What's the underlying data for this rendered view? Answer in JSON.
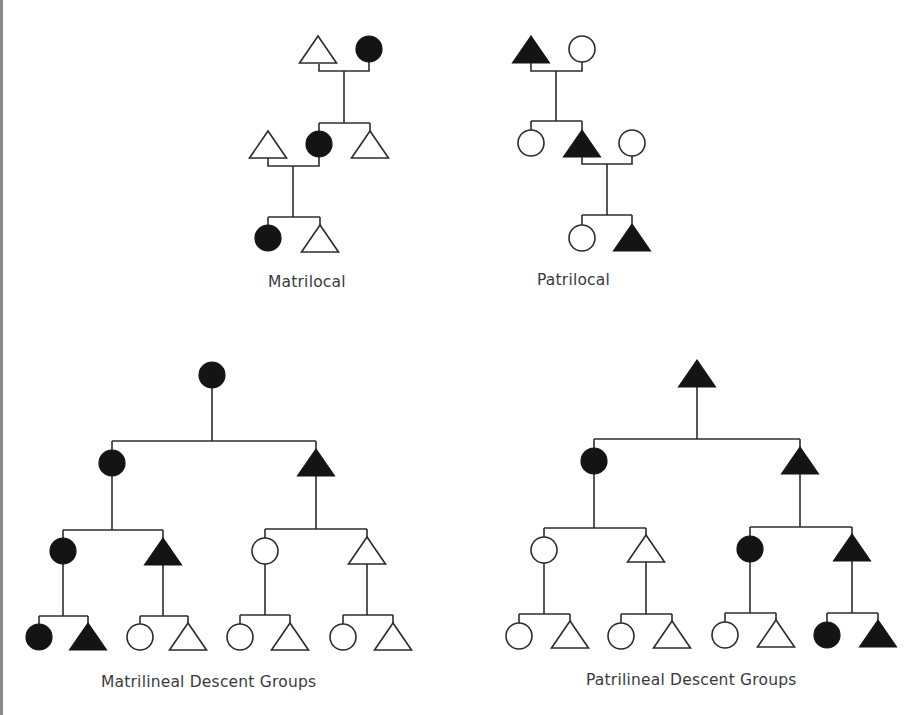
{
  "diagram": {
    "legend": {
      "female_shape": "circle",
      "male_shape": "triangle",
      "filled_meaning": "member of descent group / resident",
      "fill_color": "#141414",
      "line_color": "#2c2c2c",
      "label_color": "#3a3a3a"
    },
    "panels": [
      {
        "id": "matrilocal",
        "label": "Matrilocal",
        "label_pos": [
          268,
          287
        ],
        "nodes": [
          {
            "shape": "triangle",
            "filled": false,
            "x": 318,
            "y": 50
          },
          {
            "shape": "circle",
            "filled": true,
            "x": 369,
            "y": 49
          },
          {
            "shape": "triangle",
            "filled": false,
            "x": 268,
            "y": 145
          },
          {
            "shape": "circle",
            "filled": true,
            "x": 319,
            "y": 144
          },
          {
            "shape": "triangle",
            "filled": false,
            "x": 370,
            "y": 145
          },
          {
            "shape": "circle",
            "filled": true,
            "x": 268,
            "y": 238
          },
          {
            "shape": "triangle",
            "filled": false,
            "x": 320,
            "y": 239
          }
        ],
        "lines": [
          "M319,64 V71 H369 V62",
          "M344,71 V123",
          "M319,123 H370",
          "M319,123 V131",
          "M370,123 V132",
          "M268,158 V166 H319 V157",
          "M293,166 V217",
          "M268,217 H320",
          "M268,217 V225",
          "M320,217 V226"
        ]
      },
      {
        "id": "patrilocal",
        "label": "Patrilocal",
        "label_pos": [
          537,
          285
        ],
        "nodes": [
          {
            "shape": "triangle",
            "filled": true,
            "x": 531,
            "y": 50
          },
          {
            "shape": "circle",
            "filled": false,
            "x": 582,
            "y": 49
          },
          {
            "shape": "circle",
            "filled": false,
            "x": 531,
            "y": 143
          },
          {
            "shape": "triangle",
            "filled": true,
            "x": 582,
            "y": 144
          },
          {
            "shape": "circle",
            "filled": false,
            "x": 632,
            "y": 143
          },
          {
            "shape": "circle",
            "filled": false,
            "x": 582,
            "y": 238
          },
          {
            "shape": "triangle",
            "filled": true,
            "x": 632,
            "y": 238
          }
        ],
        "lines": [
          "M531,63 V71 H582 V62",
          "M556,71 V121",
          "M531,121 H582",
          "M531,121 V130",
          "M582,121 V130",
          "M582,157 V164 H632 V156",
          "M607,164 V215",
          "M582,215 H632",
          "M582,215 V225",
          "M632,215 V225"
        ]
      },
      {
        "id": "matrilineal",
        "label": "Matrilineal Descent Groups",
        "label_pos": [
          101,
          687
        ],
        "nodes": [
          {
            "shape": "circle",
            "filled": true,
            "x": 212,
            "y": 375
          },
          {
            "shape": "circle",
            "filled": true,
            "x": 112,
            "y": 463
          },
          {
            "shape": "triangle",
            "filled": true,
            "x": 316,
            "y": 463
          },
          {
            "shape": "circle",
            "filled": true,
            "x": 63,
            "y": 551
          },
          {
            "shape": "triangle",
            "filled": true,
            "x": 163,
            "y": 552
          },
          {
            "shape": "circle",
            "filled": false,
            "x": 265,
            "y": 551
          },
          {
            "shape": "triangle",
            "filled": false,
            "x": 367,
            "y": 551
          },
          {
            "shape": "circle",
            "filled": true,
            "x": 39,
            "y": 637
          },
          {
            "shape": "triangle",
            "filled": true,
            "x": 88,
            "y": 637
          },
          {
            "shape": "circle",
            "filled": false,
            "x": 140,
            "y": 637
          },
          {
            "shape": "triangle",
            "filled": false,
            "x": 188,
            "y": 637
          },
          {
            "shape": "circle",
            "filled": false,
            "x": 240,
            "y": 637
          },
          {
            "shape": "triangle",
            "filled": false,
            "x": 290,
            "y": 637
          },
          {
            "shape": "circle",
            "filled": false,
            "x": 343,
            "y": 637
          },
          {
            "shape": "triangle",
            "filled": false,
            "x": 393,
            "y": 637
          }
        ],
        "lines": [
          "M212,388 V441",
          "M112,441 H316",
          "M112,441 V450",
          "M316,441 V449",
          "M112,476 V530",
          "M63,530 H163",
          "M63,530 V538",
          "M163,530 V538",
          "M316,476 V529",
          "M265,529 H367",
          "M265,529 V538",
          "M367,529 V538",
          "M63,564 V616",
          "M39,616 H88",
          "M39,616 V624",
          "M88,616 V624",
          "M163,565 V616",
          "M140,616 H188",
          "M140,616 V624",
          "M188,616 V624",
          "M265,564 V615",
          "M240,615 H290",
          "M240,615 V624",
          "M290,615 V624",
          "M367,564 V615",
          "M343,615 H393",
          "M343,615 V624",
          "M393,615 V624"
        ]
      },
      {
        "id": "patrilineal",
        "label": "Patrilineal Descent Groups",
        "label_pos": [
          586,
          685
        ],
        "nodes": [
          {
            "shape": "triangle",
            "filled": true,
            "x": 697,
            "y": 374
          },
          {
            "shape": "circle",
            "filled": true,
            "x": 594,
            "y": 461
          },
          {
            "shape": "triangle",
            "filled": true,
            "x": 800,
            "y": 461
          },
          {
            "shape": "circle",
            "filled": false,
            "x": 544,
            "y": 550
          },
          {
            "shape": "triangle",
            "filled": false,
            "x": 646,
            "y": 549
          },
          {
            "shape": "circle",
            "filled": true,
            "x": 750,
            "y": 549
          },
          {
            "shape": "triangle",
            "filled": true,
            "x": 852,
            "y": 548
          },
          {
            "shape": "circle",
            "filled": false,
            "x": 519,
            "y": 636
          },
          {
            "shape": "triangle",
            "filled": false,
            "x": 570,
            "y": 635
          },
          {
            "shape": "circle",
            "filled": false,
            "x": 621,
            "y": 636
          },
          {
            "shape": "triangle",
            "filled": false,
            "x": 672,
            "y": 635
          },
          {
            "shape": "circle",
            "filled": false,
            "x": 725,
            "y": 635
          },
          {
            "shape": "triangle",
            "filled": false,
            "x": 776,
            "y": 634
          },
          {
            "shape": "circle",
            "filled": true,
            "x": 827,
            "y": 635
          },
          {
            "shape": "triangle",
            "filled": true,
            "x": 878,
            "y": 634
          }
        ],
        "lines": [
          "M697,387 V439",
          "M594,439 H800",
          "M594,439 V448",
          "M800,439 V447",
          "M594,474 V528",
          "M544,528 H646",
          "M544,528 V537",
          "M646,528 V536",
          "M800,474 V527",
          "M750,527 H852",
          "M750,527 V536",
          "M852,527 V535",
          "M544,563 V614",
          "M519,614 H570",
          "M519,614 V623",
          "M570,614 V622",
          "M646,562 V614",
          "M621,614 H672",
          "M621,614 V623",
          "M672,614 V622",
          "M750,562 V613",
          "M725,613 H776",
          "M725,613 V622",
          "M776,613 V621",
          "M852,561 V613",
          "M827,613 H878",
          "M827,613 V622",
          "M878,613 V621"
        ]
      }
    ]
  }
}
